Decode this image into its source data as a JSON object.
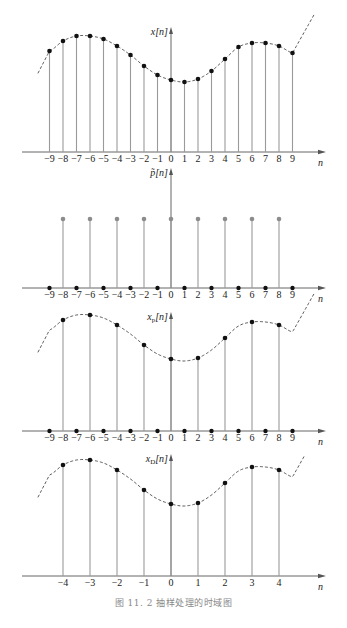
{
  "caption": "图 11. 2   抽样处理的时域图",
  "colors": {
    "stem": "#9a9a9a",
    "dot": "#111111",
    "gray_dot": "#8c8c8c",
    "axis": "#555555",
    "curve": "#333333"
  },
  "layout": {
    "n0_x": 171,
    "dx": 13.5,
    "dxD": 27
  },
  "chart_data": [
    {
      "type": "stem",
      "title": "x[n]",
      "ylabel": "x[n]",
      "xlabel": "n",
      "baseline_y": 152,
      "axis_top_y": 27,
      "x": [
        -9,
        -8,
        -7,
        -6,
        -5,
        -4,
        -3,
        -2,
        -1,
        0,
        1,
        2,
        3,
        4,
        5,
        6,
        7,
        8,
        9
      ],
      "values": [
        101,
        111,
        116,
        116,
        113,
        106,
        97,
        86,
        77,
        72,
        70,
        73,
        81,
        93,
        105,
        109,
        109,
        106,
        99
      ],
      "envelope": true,
      "tick_labels": [
        "−9",
        "−8",
        "−7",
        "−6",
        "−5",
        "−4",
        "−3",
        "−2",
        "−1",
        "0",
        "1",
        "2",
        "3",
        "4",
        "5",
        "6",
        "7",
        "8",
        "9"
      ]
    },
    {
      "type": "stem",
      "title": "p̃[n]",
      "ylabel": "p̃[n]",
      "xlabel": "n",
      "baseline_y": 288,
      "axis_top_y": 168,
      "x": [
        -9,
        -8,
        -7,
        -6,
        -5,
        -4,
        -3,
        -2,
        -1,
        0,
        1,
        2,
        3,
        4,
        5,
        6,
        7,
        8,
        9
      ],
      "values": [
        0,
        1,
        0,
        1,
        0,
        1,
        0,
        1,
        0,
        1,
        0,
        1,
        0,
        1,
        0,
        1,
        0,
        1,
        0
      ],
      "impulse_height_px": 69,
      "envelope": false,
      "tick_labels": [
        "−9",
        "−8",
        "−7",
        "−6",
        "−5",
        "−4",
        "−3",
        "−2",
        "−1",
        "0",
        "1",
        "2",
        "3",
        "4",
        "5",
        "6",
        "7",
        "8",
        "9"
      ]
    },
    {
      "type": "stem",
      "title": "xp[n]",
      "ylabel": "x",
      "ylabel_sub": "p",
      "ylabel_suffix": "[n]",
      "xlabel": "n",
      "baseline_y": 431,
      "axis_top_y": 312,
      "x": [
        -9,
        -8,
        -7,
        -6,
        -5,
        -4,
        -3,
        -2,
        -1,
        0,
        1,
        2,
        3,
        4,
        5,
        6,
        7,
        8,
        9
      ],
      "values": [
        0,
        111,
        0,
        116,
        0,
        106,
        0,
        86,
        0,
        72,
        0,
        73,
        0,
        93,
        0,
        109,
        0,
        106,
        0
      ],
      "envelope": true,
      "tick_labels": [
        "−9",
        "−8",
        "−7",
        "−6",
        "−5",
        "−4",
        "−3",
        "−2",
        "−1",
        "0",
        "1",
        "2",
        "3",
        "4",
        "5",
        "6",
        "7",
        "8",
        "9"
      ]
    },
    {
      "type": "stem",
      "title": "xD[n]",
      "ylabel": "x",
      "ylabel_sub": "D",
      "ylabel_suffix": "[n]",
      "xlabel": "n",
      "baseline_y": 576,
      "axis_top_y": 454,
      "x": [
        -4,
        -3,
        -2,
        -1,
        0,
        1,
        2,
        3,
        4
      ],
      "values": [
        111,
        116,
        106,
        86,
        72,
        73,
        93,
        109,
        106
      ],
      "envelope": true,
      "tick_labels": [
        "−4",
        "−3",
        "−2",
        "−1",
        "0",
        "1",
        "2",
        "3",
        "4"
      ]
    }
  ]
}
